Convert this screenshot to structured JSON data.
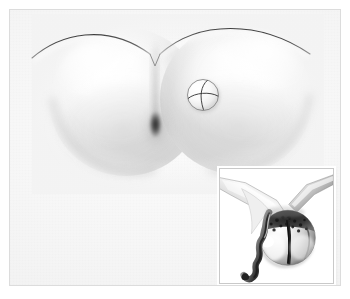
{
  "figure": {
    "domain": "scientific-grayscale-illustration",
    "title": "",
    "caption": "",
    "background_color": "#ffffff",
    "panel_color": "#f3f3f3",
    "frame_color": "#dcdcdc",
    "line_color": "#4a4a4a",
    "colors": {
      "highlight": "#ffffff",
      "midtone": "#d8d8d8",
      "shadow": "#8c8c8c",
      "dark": "#2f2f2f",
      "inset_background": "#ffffff",
      "inset_border": "#c9c9c9"
    }
  },
  "main_panel": {
    "name": "main-specimen-view",
    "description": "Bilobed rounded specimen rendered in soft grayscale with diffuse shading",
    "elements": {
      "left_lobe": {
        "name": "left-lobe",
        "label": "",
        "center": [
          116,
          92
        ],
        "width": 152,
        "height": 148
      },
      "right_lobe": {
        "name": "right-lobe",
        "label": "",
        "center": [
          226,
          89
        ],
        "width": 152,
        "height": 150
      },
      "left_arc": {
        "name": "left-outline-arc",
        "label": ""
      },
      "right_arc": {
        "name": "right-outline-arc",
        "label": ""
      },
      "central_orifice": {
        "name": "central-orifice",
        "label": "",
        "center": [
          145,
          114
        ]
      },
      "sphere_marker": {
        "name": "wireframe-sphere-marker",
        "label": "",
        "center": [
          193,
          85
        ],
        "diameter": 42
      }
    }
  },
  "inset_panel": {
    "name": "inset-detail-view",
    "label": "",
    "position": [
      209,
      158
    ],
    "size": [
      115,
      116
    ],
    "elements": {
      "sphere": {
        "name": "inset-metallic-sphere",
        "label": ""
      },
      "upper_instrument": {
        "name": "inset-upper-instrument",
        "label": ""
      },
      "left_instrument": {
        "name": "inset-left-instrument",
        "label": ""
      },
      "twisted_cord": {
        "name": "inset-twisted-cord",
        "label": ""
      },
      "dark_fissure": {
        "name": "inset-dark-fissure",
        "label": ""
      }
    }
  }
}
